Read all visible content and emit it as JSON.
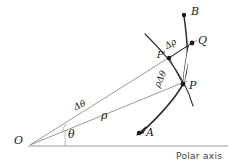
{
  "figure": {
    "type": "geometry-diagram",
    "topic": "polar-coordinates-arc-length-element",
    "axis_label": "Polar axis",
    "stroke_color": "#2b2b2b",
    "ray_color": "#8a8a8a",
    "axis_color": "#9a9a9a",
    "background": "#ffffff"
  },
  "points": [
    {
      "id": "O",
      "label": "O",
      "x": 30,
      "y": 145,
      "dot": false
    },
    {
      "id": "A",
      "label": "A",
      "x": 140,
      "y": 131,
      "dot": true
    },
    {
      "id": "B",
      "label": "B",
      "x": 186,
      "y": 13,
      "dot": true
    },
    {
      "id": "P",
      "label": "P",
      "x": 183,
      "y": 84,
      "dot": true
    },
    {
      "id": "Pp",
      "label": "P'",
      "x": 169,
      "y": 58,
      "dot": true
    },
    {
      "id": "Q",
      "label": "Q",
      "x": 192,
      "y": 43,
      "dot": true
    }
  ],
  "labels": {
    "O": "O",
    "A": "A",
    "B": "B",
    "P": "P",
    "P_prime": "P'",
    "Q": "Q",
    "rho": "ρ",
    "theta": "θ",
    "delta_theta": "Δθ",
    "delta_rho": "Δρ",
    "rho_delta_theta": "ρΔθ",
    "polar_axis": "Polar axis"
  },
  "geometry": {
    "origin": {
      "x": 30,
      "y": 145
    },
    "polar_axis": {
      "x1": 28,
      "y1": 146,
      "x2": 228,
      "y2": 146
    },
    "ray_OP": {
      "x1": 30,
      "y1": 145,
      "x2": 186,
      "y2": 82
    },
    "ray_OQ": {
      "x1": 30,
      "y1": 145,
      "x2": 196,
      "y2": 41
    },
    "vertical_tick": {
      "x": 65,
      "y1": 130,
      "y2": 146
    },
    "theta_angle_deg": 22,
    "delta_theta_deg": 10
  }
}
